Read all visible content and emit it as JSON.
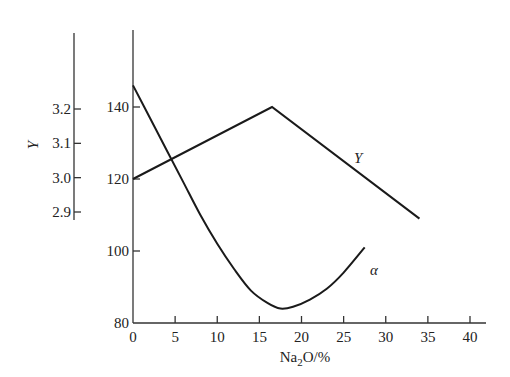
{
  "chart_data": {
    "type": "line",
    "title": "",
    "xlabel": "Na2O/%",
    "xlabel_main": "Na",
    "xlabel_sub": "2",
    "xlabel_rest": "O/%",
    "xlim": [
      0,
      42
    ],
    "x_ticks": [
      0,
      5,
      10,
      15,
      20,
      25,
      30,
      35,
      40
    ],
    "y_axes": [
      {
        "name": "alpha-axis",
        "label": "",
        "ylim": [
          80,
          150
        ],
        "ticks": [
          80,
          100,
          120,
          140
        ]
      },
      {
        "name": "Y-axis",
        "label": "Y",
        "ylim": [
          2.85,
          3.3
        ],
        "ticks": [
          2.9,
          3.0,
          3.1,
          3.2
        ]
      }
    ],
    "series": [
      {
        "name": "Y",
        "label": "Y",
        "axis": "alpha-axis-scale",
        "x": [
          0,
          16.5,
          34
        ],
        "values": [
          120,
          140,
          109
        ]
      },
      {
        "name": "α",
        "label": "α",
        "axis": "alpha-axis",
        "x": [
          0,
          2,
          4,
          6,
          8,
          10,
          12,
          14,
          16,
          17.5,
          19,
          21,
          23,
          25,
          27.5
        ],
        "values": [
          146,
          137,
          128,
          119,
          110,
          102,
          95,
          89,
          85.5,
          84,
          84.5,
          86.5,
          89.5,
          94,
          101
        ]
      }
    ],
    "grid": false,
    "legend": "inline labels"
  },
  "labels": {
    "left_axis_title": "Y",
    "series_Y": "Y",
    "series_alpha": "α"
  }
}
